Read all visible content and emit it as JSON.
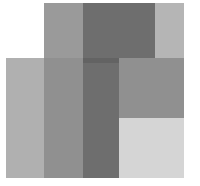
{
  "figure": {
    "background_color": "#ffffff",
    "width": 200,
    "height": 186
  },
  "palette": {
    "white": "#ffffff",
    "pale_gray": "#d5d5d5",
    "light_gray": "#c2c2c2",
    "top_right_gray": "#b5b5b5",
    "light_column": "#b0b0b0",
    "mid_light_gray": "#a5a5a5",
    "top_left_gray": "#9a9a9a",
    "mid_column": "#909090",
    "mid_dark_gray": "#848484",
    "dark_column": "#6e6e6e",
    "darkest_overlap": "#636363"
  },
  "shapes": [
    {
      "name": "top-rect-left-band",
      "region": "top rectangle, light column",
      "x": 44,
      "y": 3,
      "w": 39,
      "h": 60,
      "color": "#9a9a9a"
    },
    {
      "name": "top-rect-dark-band",
      "region": "top rectangle, dark column",
      "x": 83,
      "y": 3,
      "w": 72,
      "h": 60,
      "color": "#6e6e6e"
    },
    {
      "name": "top-rect-right-band",
      "region": "top rectangle, right light column",
      "x": 155,
      "y": 3,
      "w": 29,
      "h": 60,
      "color": "#b5b5b5"
    },
    {
      "name": "bottom-rect-light-column",
      "region": "bottom rectangle, leftmost light column",
      "x": 6,
      "y": 58,
      "w": 38,
      "h": 120,
      "color": "#b0b0b0"
    },
    {
      "name": "bottom-rect-mid-column",
      "region": "bottom rectangle, medium column",
      "x": 44,
      "y": 58,
      "w": 39,
      "h": 120,
      "color": "#909090"
    },
    {
      "name": "bottom-rect-dark-column",
      "region": "bottom rectangle, dark column",
      "x": 83,
      "y": 58,
      "w": 36,
      "h": 120,
      "color": "#6e6e6e"
    },
    {
      "name": "bottom-rect-upper-right",
      "region": "bottom rectangle, upper right quadrant",
      "x": 119,
      "y": 58,
      "w": 65,
      "h": 60,
      "color": "#909090"
    },
    {
      "name": "bottom-rect-lower-right",
      "region": "bottom rectangle, lower right quadrant",
      "x": 119,
      "y": 118,
      "w": 65,
      "h": 60,
      "color": "#d5d5d5"
    },
    {
      "name": "overlap-dark-band",
      "region": "intersection of both rectangles, dark column",
      "x": 83,
      "y": 58,
      "w": 36,
      "h": 5,
      "color": "#636363"
    }
  ]
}
